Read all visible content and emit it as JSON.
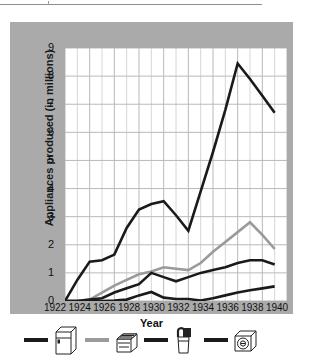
{
  "chart_data": {
    "type": "line",
    "title": "",
    "xlabel": "Year",
    "ylabel": "Appliances produced (in millions)",
    "xlim": [
      1922,
      1940
    ],
    "ylim": [
      0,
      9
    ],
    "grid": true,
    "x_ticks": [
      1922,
      1924,
      1926,
      1928,
      1930,
      1932,
      1934,
      1936,
      1938,
      1940
    ],
    "y_ticks": [
      0,
      1,
      2,
      3,
      4,
      5,
      6,
      7,
      8,
      9
    ],
    "minor_x_gridlines": true,
    "legend_position": "below-figure",
    "x": [
      1922,
      1923,
      1924,
      1925,
      1926,
      1927,
      1928,
      1929,
      1930,
      1931,
      1932,
      1933,
      1934,
      1935,
      1936,
      1937,
      1938,
      1939
    ],
    "series": [
      {
        "name": "refrigerator",
        "color": "#1a1a1a",
        "icon": "refrigerator-icon",
        "values": [
          0.0,
          0.75,
          1.4,
          1.45,
          1.65,
          2.6,
          3.25,
          3.45,
          3.55,
          3.05,
          2.5,
          3.9,
          5.3,
          6.8,
          8.45,
          7.9,
          7.3,
          6.7
        ]
      },
      {
        "name": "range-stove",
        "color": "#9a9a9a",
        "icon": "stove-icon",
        "values": [
          0.0,
          0.0,
          0.05,
          0.3,
          0.55,
          0.75,
          0.95,
          1.05,
          1.2,
          1.15,
          1.1,
          1.35,
          1.75,
          2.1,
          2.45,
          2.8,
          2.35,
          1.85
        ]
      },
      {
        "name": "vacuum-cleaner",
        "color": "#1a1a1a",
        "icon": "vacuum-icon",
        "values": [
          0.0,
          0.0,
          0.05,
          0.1,
          0.3,
          0.45,
          0.6,
          1.0,
          0.85,
          0.7,
          0.85,
          1.0,
          1.1,
          1.2,
          1.35,
          1.45,
          1.45,
          1.3
        ]
      },
      {
        "name": "washing-machine",
        "color": "#1a1a1a",
        "icon": "washer-icon",
        "values": [
          0.0,
          0.0,
          0.0,
          0.0,
          0.02,
          0.05,
          0.2,
          0.32,
          0.12,
          0.07,
          0.07,
          0.02,
          0.1,
          0.2,
          0.3,
          0.38,
          0.45,
          0.52
        ]
      }
    ]
  },
  "axes": {
    "y_label": "Appliances produced (in millions)",
    "x_label": "Year",
    "y_tick_labels": [
      "9",
      "8",
      "7",
      "6",
      "5",
      "4",
      "3",
      "2",
      "1",
      "0"
    ],
    "x_tick_labels": [
      "1922",
      "1924",
      "1926",
      "1928",
      "1930",
      "1932",
      "1934",
      "1936",
      "1938",
      "1940"
    ]
  },
  "legend": {
    "items": [
      {
        "icon": "refrigerator-icon",
        "color": "#1a1a1a"
      },
      {
        "icon": "stove-icon",
        "color": "#9a9a9a"
      },
      {
        "icon": "vacuum-icon",
        "color": "#1a1a1a"
      },
      {
        "icon": "washer-icon",
        "color": "#1a1a1a"
      }
    ]
  },
  "colors": {
    "panel_background": "#aaaaaa",
    "plot_background": "#ffffff",
    "grid_major": "#b9b9b9",
    "grid_minor": "#d6d6d6",
    "dark_series": "#1a1a1a",
    "gray_series": "#9a9a9a"
  }
}
